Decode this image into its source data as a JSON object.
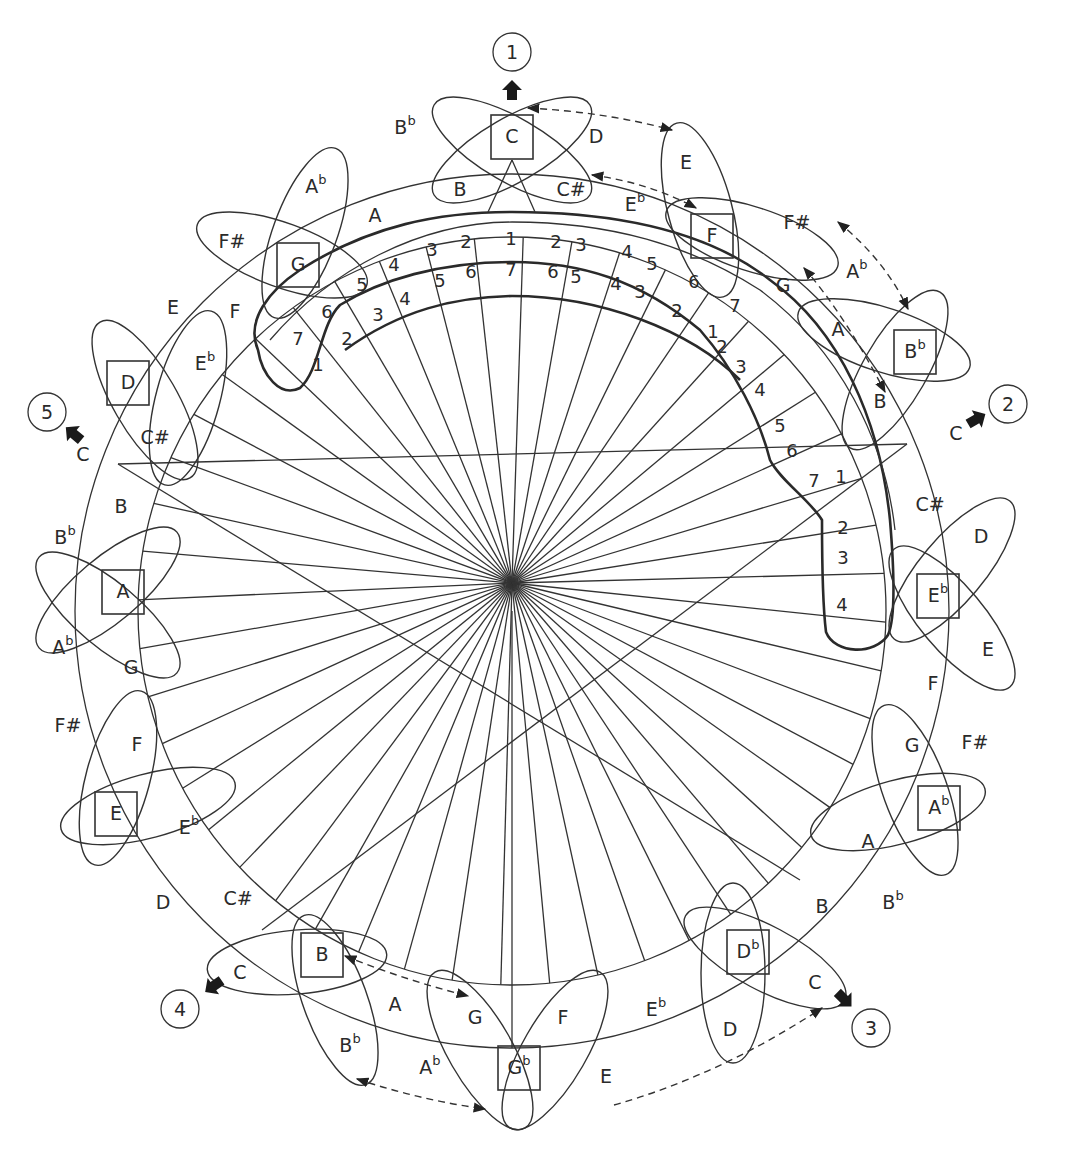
{
  "diagram": {
    "center": [
      512,
      611
    ],
    "outer_radius": 437,
    "inner_radius": 374,
    "hub": [
      512,
      583
    ]
  },
  "route_markers": [
    {
      "id": "1",
      "label": "1",
      "x": 512,
      "y": 52,
      "arrow_label": ""
    },
    {
      "id": "2",
      "label": "2",
      "x": 1008,
      "y": 404,
      "arrow_label": "C"
    },
    {
      "id": "3",
      "label": "3",
      "x": 871,
      "y": 1028,
      "arrow_label": "C"
    },
    {
      "id": "4",
      "label": "4",
      "x": 180,
      "y": 1009,
      "arrow_label": "C"
    },
    {
      "id": "5",
      "label": "5",
      "x": 47,
      "y": 412,
      "arrow_label": "C"
    }
  ],
  "boxed_keys": [
    {
      "note": "C",
      "acc": "",
      "x": 512,
      "y": 137
    },
    {
      "note": "F",
      "acc": "",
      "x": 712,
      "y": 236
    },
    {
      "note": "B",
      "acc": "b",
      "x": 915,
      "y": 352
    },
    {
      "note": "E",
      "acc": "b",
      "x": 938,
      "y": 596
    },
    {
      "note": "A",
      "acc": "b",
      "x": 939,
      "y": 808
    },
    {
      "note": "D",
      "acc": "b",
      "x": 748,
      "y": 952
    },
    {
      "note": "G",
      "acc": "b",
      "x": 519,
      "y": 1068
    },
    {
      "note": "B",
      "acc": "",
      "x": 322,
      "y": 955
    },
    {
      "note": "E",
      "acc": "",
      "x": 116,
      "y": 814
    },
    {
      "note": "A",
      "acc": "",
      "x": 123,
      "y": 592
    },
    {
      "note": "D",
      "acc": "",
      "x": 128,
      "y": 383
    },
    {
      "note": "G",
      "acc": "",
      "x": 298,
      "y": 265
    }
  ],
  "note_labels": [
    {
      "note": "B",
      "acc": "b",
      "x": 405,
      "y": 128
    },
    {
      "note": "D",
      "acc": "",
      "x": 596,
      "y": 137
    },
    {
      "note": "B",
      "acc": "",
      "x": 460,
      "y": 190
    },
    {
      "note": "C#",
      "acc": "",
      "x": 571,
      "y": 190
    },
    {
      "note": "E",
      "acc": "",
      "x": 686,
      "y": 163
    },
    {
      "note": "E",
      "acc": "b",
      "x": 635,
      "y": 205
    },
    {
      "note": "F#",
      "acc": "",
      "x": 797,
      "y": 223
    },
    {
      "note": "A",
      "acc": "b",
      "x": 316,
      "y": 187
    },
    {
      "note": "A",
      "acc": "",
      "x": 375,
      "y": 216
    },
    {
      "note": "F#",
      "acc": "",
      "x": 232,
      "y": 242
    },
    {
      "note": "G",
      "acc": "",
      "x": 783,
      "y": 286
    },
    {
      "note": "A",
      "acc": "b",
      "x": 857,
      "y": 272
    },
    {
      "note": "E",
      "acc": "",
      "x": 173,
      "y": 308
    },
    {
      "note": "F",
      "acc": "",
      "x": 235,
      "y": 312
    },
    {
      "note": "A",
      "acc": "",
      "x": 838,
      "y": 330
    },
    {
      "note": "E",
      "acc": "b",
      "x": 205,
      "y": 364
    },
    {
      "note": "B",
      "acc": "",
      "x": 880,
      "y": 402
    },
    {
      "note": "C#",
      "acc": "",
      "x": 155,
      "y": 438
    },
    {
      "note": "B",
      "acc": "",
      "x": 121,
      "y": 507
    },
    {
      "note": "C#",
      "acc": "",
      "x": 930,
      "y": 505
    },
    {
      "note": "B",
      "acc": "b",
      "x": 65,
      "y": 538
    },
    {
      "note": "D",
      "acc": "",
      "x": 981,
      "y": 537
    },
    {
      "note": "A",
      "acc": "b",
      "x": 63,
      "y": 648
    },
    {
      "note": "E",
      "acc": "",
      "x": 988,
      "y": 650
    },
    {
      "note": "G",
      "acc": "",
      "x": 131,
      "y": 668
    },
    {
      "note": "F",
      "acc": "",
      "x": 933,
      "y": 684
    },
    {
      "note": "F#",
      "acc": "",
      "x": 68,
      "y": 726
    },
    {
      "note": "G",
      "acc": "",
      "x": 912,
      "y": 746
    },
    {
      "note": "F#",
      "acc": "",
      "x": 975,
      "y": 743
    },
    {
      "note": "F",
      "acc": "",
      "x": 137,
      "y": 745
    },
    {
      "note": "E",
      "acc": "b",
      "x": 189,
      "y": 828
    },
    {
      "note": "A",
      "acc": "",
      "x": 868,
      "y": 842
    },
    {
      "note": "D",
      "acc": "",
      "x": 163,
      "y": 903
    },
    {
      "note": "C#",
      "acc": "",
      "x": 238,
      "y": 899
    },
    {
      "note": "B",
      "acc": "",
      "x": 822,
      "y": 907
    },
    {
      "note": "B",
      "acc": "b",
      "x": 893,
      "y": 903
    },
    {
      "note": "C",
      "acc": "",
      "x": 240,
      "y": 973
    },
    {
      "note": "C",
      "acc": "",
      "x": 815,
      "y": 983
    },
    {
      "note": "A",
      "acc": "",
      "x": 395,
      "y": 1005
    },
    {
      "note": "G",
      "acc": "",
      "x": 475,
      "y": 1018
    },
    {
      "note": "F",
      "acc": "",
      "x": 563,
      "y": 1018
    },
    {
      "note": "E",
      "acc": "b",
      "x": 656,
      "y": 1010
    },
    {
      "note": "B",
      "acc": "b",
      "x": 350,
      "y": 1046
    },
    {
      "note": "A",
      "acc": "b",
      "x": 430,
      "y": 1068
    },
    {
      "note": "D",
      "acc": "",
      "x": 730,
      "y": 1030
    },
    {
      "note": "E",
      "acc": "",
      "x": 606,
      "y": 1077
    }
  ],
  "degree_numbers": [
    {
      "n": "1",
      "x": 511,
      "y": 240
    },
    {
      "n": "7",
      "x": 511,
      "y": 271
    },
    {
      "n": "2",
      "x": 466,
      "y": 243
    },
    {
      "n": "6",
      "x": 471,
      "y": 273
    },
    {
      "n": "3",
      "x": 432,
      "y": 251
    },
    {
      "n": "5",
      "x": 440,
      "y": 282
    },
    {
      "n": "4",
      "x": 394,
      "y": 266
    },
    {
      "n": "4",
      "x": 405,
      "y": 300
    },
    {
      "n": "5",
      "x": 362,
      "y": 286
    },
    {
      "n": "3",
      "x": 378,
      "y": 316
    },
    {
      "n": "6",
      "x": 327,
      "y": 313
    },
    {
      "n": "2",
      "x": 347,
      "y": 340
    },
    {
      "n": "7",
      "x": 298,
      "y": 340
    },
    {
      "n": "1",
      "x": 318,
      "y": 366
    },
    {
      "n": "2",
      "x": 556,
      "y": 243
    },
    {
      "n": "6",
      "x": 553,
      "y": 273
    },
    {
      "n": "3",
      "x": 581,
      "y": 246
    },
    {
      "n": "5",
      "x": 576,
      "y": 278
    },
    {
      "n": "4",
      "x": 627,
      "y": 253
    },
    {
      "n": "4",
      "x": 616,
      "y": 285
    },
    {
      "n": "5",
      "x": 652,
      "y": 265
    },
    {
      "n": "3",
      "x": 640,
      "y": 293
    },
    {
      "n": "6",
      "x": 694,
      "y": 283
    },
    {
      "n": "2",
      "x": 677,
      "y": 312
    },
    {
      "n": "7",
      "x": 735,
      "y": 307
    },
    {
      "n": "1",
      "x": 713,
      "y": 333
    },
    {
      "n": "2",
      "x": 722,
      "y": 348
    },
    {
      "n": "3",
      "x": 741,
      "y": 368
    },
    {
      "n": "4",
      "x": 760,
      "y": 391
    },
    {
      "n": "5",
      "x": 780,
      "y": 427
    },
    {
      "n": "6",
      "x": 792,
      "y": 452
    },
    {
      "n": "7",
      "x": 814,
      "y": 482
    },
    {
      "n": "1",
      "x": 841,
      "y": 478
    },
    {
      "n": "2",
      "x": 843,
      "y": 529
    },
    {
      "n": "3",
      "x": 843,
      "y": 559
    },
    {
      "n": "4",
      "x": 842,
      "y": 606
    }
  ]
}
